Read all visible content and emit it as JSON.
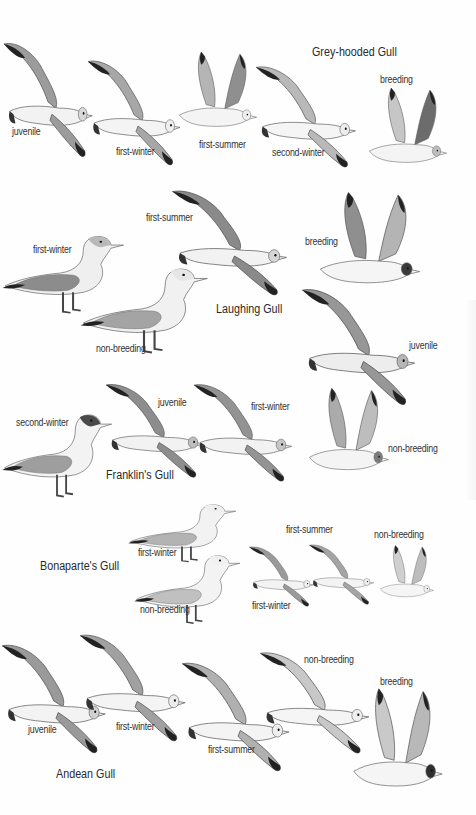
{
  "plate": {
    "species": [
      {
        "name": "Grey-hooded Gull",
        "labels": [
          "juvenile",
          "first-winter",
          "first-summer",
          "second-winter",
          "breeding"
        ]
      },
      {
        "name": "Laughing Gull",
        "labels": [
          "first-summer",
          "breeding",
          "first-winter",
          "non-breeding",
          "juvenile"
        ]
      },
      {
        "name": "Franklin's Gull",
        "labels": [
          "second-winter",
          "juvenile",
          "first-winter",
          "non-breeding"
        ]
      },
      {
        "name": "Bonaparte's Gull",
        "labels": [
          "first-winter",
          "non-breeding",
          "first-summer",
          "non-breeding",
          "first-winter"
        ]
      },
      {
        "name": "Andean Gull",
        "labels": [
          "juvenile",
          "first-winter",
          "first-summer",
          "non-breeding",
          "breeding"
        ]
      }
    ]
  },
  "colors": {
    "background": "#ffffff",
    "text": "#333333",
    "mantle_grey": "#a9a9a9",
    "dark_grey": "#6e6e6e",
    "wingtip_black": "#1e1e1e",
    "hood_dark": "#3a3a3a"
  }
}
